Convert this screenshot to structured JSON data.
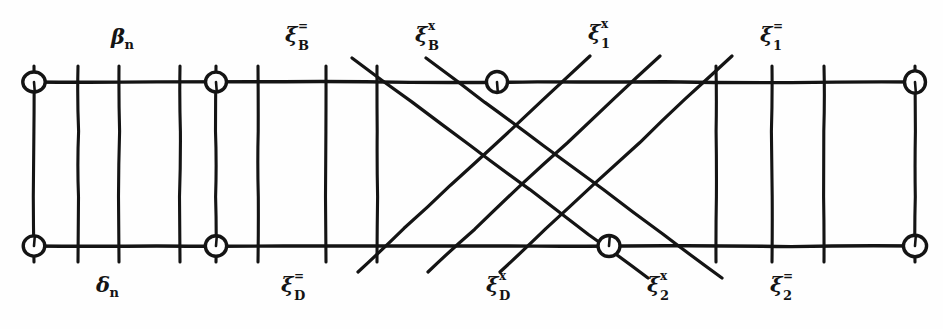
{
  "figure": {
    "kind": "hand-drawn-lattice-diagram",
    "title": "",
    "ink_color": "#141414",
    "paper_color": "#fefefe",
    "width": 943,
    "height": 329
  },
  "labels": {
    "top": [
      {
        "id": "beta-n",
        "base": "β",
        "sup": "",
        "sub": "n",
        "x": 111,
        "y": 24,
        "style": "simple"
      },
      {
        "id": "xi-B-eq",
        "base": "ξ",
        "sup": "=",
        "sub": "B",
        "x": 285,
        "y": 22,
        "style": "stacked"
      },
      {
        "id": "xi-B-x",
        "base": "ξ",
        "sup": "x",
        "sub": "B",
        "x": 415,
        "y": 22,
        "style": "stacked"
      },
      {
        "id": "xi-1-x",
        "base": "ξ",
        "sup": "x",
        "sub": "1",
        "x": 588,
        "y": 20,
        "style": "stacked"
      },
      {
        "id": "xi-1-eq",
        "base": "ξ",
        "sup": "=",
        "sub": "1",
        "x": 760,
        "y": 22,
        "style": "stacked"
      }
    ],
    "bottom": [
      {
        "id": "delta-n",
        "base": "δ",
        "sup": "",
        "sub": "n",
        "x": 96,
        "y": 272,
        "style": "simple"
      },
      {
        "id": "xi-D-eq",
        "base": "ξ",
        "sup": "=",
        "sub": "D",
        "x": 281,
        "y": 272,
        "style": "stacked"
      },
      {
        "id": "xi-D-x",
        "base": "ξ",
        "sup": "x",
        "sub": "D",
        "x": 486,
        "y": 272,
        "style": "stacked"
      },
      {
        "id": "xi-2-x",
        "base": "ξ",
        "sup": "x",
        "sub": "2",
        "x": 647,
        "y": 272,
        "style": "stacked"
      },
      {
        "id": "xi-2-eq",
        "base": "ξ",
        "sup": "=",
        "sub": "2",
        "x": 770,
        "y": 272,
        "style": "stacked"
      }
    ]
  },
  "geometry": {
    "top_rail_y": 82,
    "bottom_rail_y": 246,
    "rail_x_start": 30,
    "rail_x_end": 918,
    "nodes": [
      {
        "id": "node-top-left",
        "x": 34,
        "y": 82,
        "r": 11
      },
      {
        "id": "node-top-mid",
        "x": 216,
        "y": 82,
        "r": 11
      },
      {
        "id": "node-top-cross",
        "x": 497,
        "y": 82,
        "r": 11
      },
      {
        "id": "node-top-right",
        "x": 915,
        "y": 82,
        "r": 11
      },
      {
        "id": "node-bot-left",
        "x": 34,
        "y": 246,
        "r": 11
      },
      {
        "id": "node-bot-mid",
        "x": 216,
        "y": 246,
        "r": 11
      },
      {
        "id": "node-bot-cross",
        "x": 609,
        "y": 246,
        "r": 11
      },
      {
        "id": "node-bot-right",
        "x": 915,
        "y": 246,
        "r": 11
      }
    ],
    "verticals": [
      {
        "id": "vline-1",
        "x": 34,
        "full": true
      },
      {
        "id": "vline-2",
        "x": 78,
        "full": true
      },
      {
        "id": "vline-3",
        "x": 119,
        "full": true
      },
      {
        "id": "vline-4",
        "x": 180,
        "full": true
      },
      {
        "id": "vline-5",
        "x": 216,
        "full": true
      },
      {
        "id": "vline-6",
        "x": 258,
        "full": true
      },
      {
        "id": "vline-7",
        "x": 326,
        "full": true
      },
      {
        "id": "vline-8",
        "x": 377,
        "full": true
      },
      {
        "id": "vline-9",
        "x": 716,
        "full": true
      },
      {
        "id": "vline-10",
        "x": 772,
        "full": true
      },
      {
        "id": "vline-11",
        "x": 824,
        "full": true
      },
      {
        "id": "vline-12",
        "x": 915,
        "full": true
      }
    ],
    "diagonals_down": [
      {
        "id": "diag-down-1",
        "x1": 352,
        "y1": 58,
        "x2": 648,
        "y2": 278
      },
      {
        "id": "diag-down-2",
        "x1": 426,
        "y1": 58,
        "x2": 722,
        "y2": 278
      }
    ],
    "diagonals_up": [
      {
        "id": "diag-up-1",
        "x1": 358,
        "y1": 272,
        "x2": 590,
        "y2": 56
      },
      {
        "id": "diag-up-2",
        "x1": 428,
        "y1": 272,
        "x2": 660,
        "y2": 56
      },
      {
        "id": "diag-up-3",
        "x1": 500,
        "y1": 272,
        "x2": 732,
        "y2": 56
      }
    ]
  }
}
